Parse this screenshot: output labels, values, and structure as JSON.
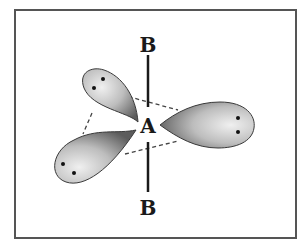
{
  "diagram": {
    "type": "molecular-geometry",
    "central_atom": {
      "label": "A"
    },
    "bonded_atoms": [
      {
        "label": "B",
        "position": "top"
      },
      {
        "label": "B",
        "position": "bottom"
      }
    ],
    "lone_pairs": [
      {
        "position": "upper-left",
        "electrons": 2
      },
      {
        "position": "lower-left",
        "electrons": 2
      },
      {
        "position": "right",
        "electrons": 2
      }
    ],
    "equatorial_plane": "dashed triangle"
  },
  "colors": {
    "frame": "#555555",
    "bond": "#1a1a1a",
    "lobe_light": "#e6e6e6",
    "lobe_dark": "#6a6a6a",
    "electron": "#111111",
    "dashed": "#444444"
  }
}
